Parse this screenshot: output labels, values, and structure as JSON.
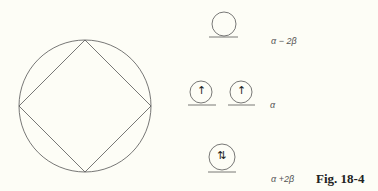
{
  "figure": {
    "caption": "Fig. 18-4",
    "polygon": "square inscribed in circle (Frost circle)",
    "levels": [
      {
        "energy_label": "α − 2β",
        "orbitals": 1,
        "electrons": "empty"
      },
      {
        "energy_label": "α",
        "orbitals": 2,
        "electrons": "one up arrow each"
      },
      {
        "energy_label": "α +2β",
        "orbitals": 1,
        "electrons": "paired up/down"
      }
    ]
  },
  "glyphs": {
    "up": "↑",
    "paired": "⇅"
  }
}
